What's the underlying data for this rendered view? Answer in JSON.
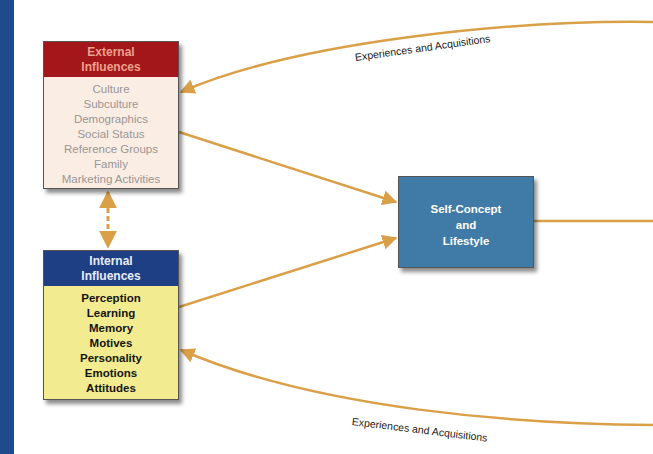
{
  "diagram": {
    "external_influences": {
      "title_line1": "External",
      "title_line2": "Influences",
      "items": [
        "Culture",
        "Subculture",
        "Demographics",
        "Social Status",
        "Reference Groups",
        "Family",
        "Marketing Activities"
      ],
      "header_color": "#a3161a",
      "body_color": "#faeee4"
    },
    "internal_influences": {
      "title_line1": "Internal",
      "title_line2": "Influences",
      "items": [
        "Perception",
        "Learning",
        "Memory",
        "Motives",
        "Personality",
        "Emotions",
        "Attitudes"
      ],
      "header_color": "#1f3f85",
      "body_color": "#f2eb8f"
    },
    "self_concept": {
      "line1": "Self-Concept",
      "line2": "and",
      "line3": "Lifestyle",
      "color": "#3f7ba6"
    },
    "flow_labels": {
      "top": "Experiences and Acquisitions",
      "bottom": "Experiences and Acquisitions"
    },
    "arrow_color": "#d9a048",
    "side_bar_color": "#1f4a8e"
  }
}
